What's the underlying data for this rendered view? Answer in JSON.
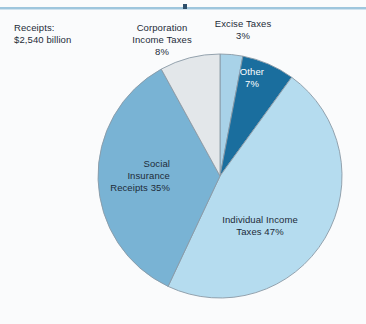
{
  "header": {
    "rule_marker": "section-marker"
  },
  "annotations": {
    "receipts_total": "Receipts:\n$2,540 billion"
  },
  "colors": {
    "background": "#fafbfc",
    "rule": "#9ec6dd",
    "marker": "#2d4f6b",
    "text": "#1d2b38",
    "slice_outline": "#8a9aa6"
  },
  "chart_data": {
    "type": "pie",
    "title": "",
    "subtitle": "",
    "xlabel": "",
    "ylabel": "",
    "legend_position": "none",
    "grid": false,
    "total_label": "Receipts: $2,540 billion",
    "total_value": 2540,
    "total_units": "billion dollars",
    "start_angle_deg": 0,
    "direction": "clockwise",
    "categories": [
      "Excise Taxes",
      "Other",
      "Individual Income Taxes",
      "Social Insurance Receipts",
      "Corporation Income Taxes"
    ],
    "values": [
      3,
      7,
      47,
      35,
      8
    ],
    "value_units": "percent",
    "slices": [
      {
        "name": "Excise Taxes",
        "value": 3,
        "label": "Excise Taxes\n3%",
        "label_text": "Excise Taxes",
        "label_pct": "3%",
        "color": "#a8d2e8",
        "label_color": "#1d2b38",
        "label_placement": "outside-top"
      },
      {
        "name": "Other",
        "value": 7,
        "label": "Other\n7%",
        "label_text": "Other",
        "label_pct": "7%",
        "color": "#1a6e9e",
        "label_color": "#ffffff",
        "label_placement": "inside"
      },
      {
        "name": "Individual Income Taxes",
        "value": 47,
        "label": "Individual Income\nTaxes 47%",
        "label_text": "Individual Income Taxes",
        "label_pct": "47%",
        "color": "#b5dcef",
        "label_color": "#1d2b38",
        "label_placement": "inside"
      },
      {
        "name": "Social Insurance Receipts",
        "value": 35,
        "label": "Social\nInsurance\nReceipts  35%",
        "label_text": "Social Insurance Receipts",
        "label_pct": "35%",
        "color": "#79b3d4",
        "label_color": "#1d2b38",
        "label_placement": "inside"
      },
      {
        "name": "Corporation Income Taxes",
        "value": 8,
        "label": "Corporation\nIncome Taxes\n8%",
        "label_text": "Corporation Income Taxes",
        "label_pct": "8%",
        "color": "#e3e7ea",
        "label_color": "#1d2b38",
        "label_placement": "outside-top"
      }
    ],
    "geometry": {
      "center_x": 220,
      "center_y": 176,
      "radius": 122
    }
  }
}
